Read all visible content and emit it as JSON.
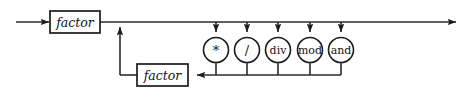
{
  "diagram": {
    "kind": "railroad-syntax-diagram",
    "rule_name": "term",
    "colors": {
      "background": "#ffffff",
      "line": "#2b2b2b",
      "node_stroke": "#1c1c1c",
      "node_fill": "#ffffff",
      "text": "#141414"
    },
    "entry": {
      "label": "",
      "arrow": "arrow-right"
    },
    "exit": {
      "label": "",
      "arrow": "arrow-right"
    },
    "nonterminals": [
      {
        "id": "factor-main",
        "label": "factor",
        "x": 50,
        "y": 11,
        "w": 50,
        "h": 22
      },
      {
        "id": "factor-loop",
        "label": "factor",
        "x": 137,
        "y": 64,
        "w": 51,
        "h": 22
      }
    ],
    "terminals": [
      {
        "id": "op-times",
        "label": "*",
        "cx": 216,
        "cy": 50,
        "r": 12.5,
        "glyph": true
      },
      {
        "id": "op-divide",
        "label": "/",
        "cx": 247,
        "cy": 50,
        "r": 12.5,
        "glyph": true
      },
      {
        "id": "op-div",
        "label": "div",
        "cx": 278,
        "cy": 50,
        "r": 12.5,
        "glyph": false
      },
      {
        "id": "op-mod",
        "label": "mod",
        "cx": 310,
        "cy": 50,
        "r": 12.5,
        "glyph": false
      },
      {
        "id": "op-and",
        "label": "and",
        "cx": 341,
        "cy": 50,
        "r": 12.5,
        "glyph": false
      }
    ],
    "main_line_y": 22,
    "return_line_y": 75,
    "return_up_x": 120,
    "loop_arrow_in_x": 193,
    "left_start_x": 16,
    "right_end_x": 466
  }
}
